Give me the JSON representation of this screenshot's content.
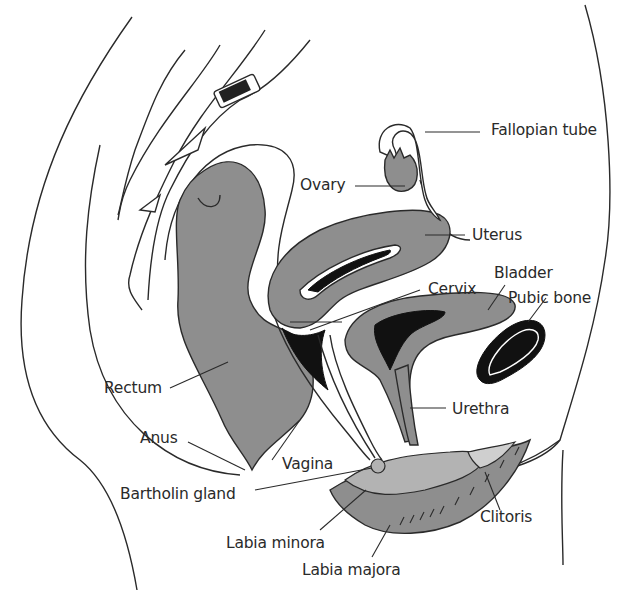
{
  "diagram": {
    "colors": {
      "organ_fill": "#8e8e8e",
      "light_fill": "#b3b3b3",
      "dark_fill": "#111111",
      "outline": "#2a2a2a",
      "background": "#ffffff"
    },
    "labels": {
      "fallopian_tube": "Fallopian tube",
      "ovary": "Ovary",
      "uterus": "Uterus",
      "bladder": "Bladder",
      "cervix": "Cervix",
      "pubic_bone": "Pubic bone",
      "rectum": "Rectum",
      "urethra": "Urethra",
      "anus": "Anus",
      "vagina": "Vagina",
      "bartholin_gland": "Bartholin gland",
      "clitoris": "Clitoris",
      "labia_minora": "Labia minora",
      "labia_majora": "Labia majora"
    }
  }
}
